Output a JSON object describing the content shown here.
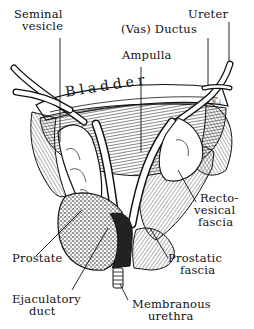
{
  "figure": {
    "type": "anatomical-illustration",
    "style": "black-and-white pen-and-ink",
    "signature": "N.J.",
    "colors": {
      "ink": "#111111",
      "background": "#ffffff"
    }
  },
  "labels": {
    "seminal_vesicle": [
      "Seminal",
      "vesicle"
    ],
    "vas_ductus": "(Vas) Ductus",
    "ampulla": "Ampulla",
    "ureter": "Ureter",
    "bladder": "Bladder",
    "recto_vesical_fascia": [
      "Recto-",
      "vesical",
      "fascia"
    ],
    "prostate": "Prostate",
    "prostatic_fascia": [
      "Prostatic",
      "fascia"
    ],
    "ejaculatory_duct": [
      "Ejaculatory",
      "duct"
    ],
    "membranous_urethra": [
      "Membranous",
      "urethra"
    ]
  }
}
